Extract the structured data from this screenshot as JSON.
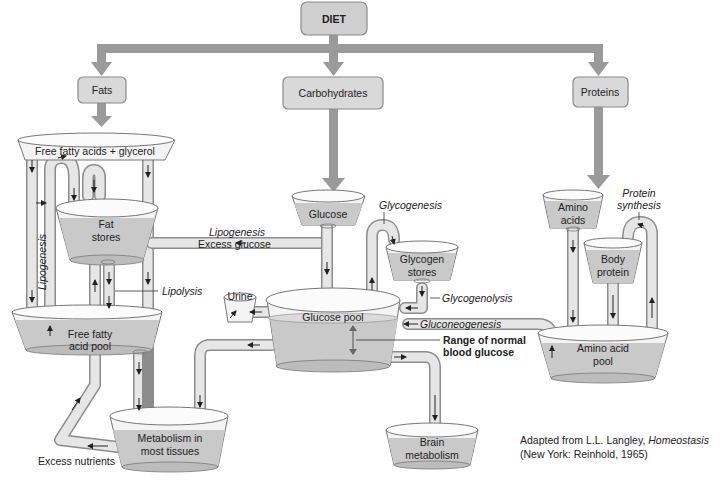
{
  "diagram": {
    "top": {
      "label": "DIET"
    },
    "sources": [
      {
        "id": "fats",
        "label": "Fats"
      },
      {
        "id": "carbohydrates",
        "label": "Carbohydrates"
      },
      {
        "id": "proteins",
        "label": "Proteins"
      }
    ],
    "reservoirs": {
      "ffa_glycerol": "Free fatty acids + glycerol",
      "fat_stores_1": "Fat",
      "fat_stores_2": "stores",
      "ffa_pool_1": "Free fatty",
      "ffa_pool_2": "acid pool",
      "metabolism_1": "Metabolism in",
      "metabolism_2": "most tissues",
      "glucose": "Glucose",
      "glycogen_1": "Glycogen",
      "glycogen_2": "stores",
      "urine": "Urine",
      "glucose_pool": "Glucose pool",
      "brain_1": "Brain",
      "brain_2": "metabolism",
      "amino_1": "Amino",
      "amino_2": "acids",
      "body_protein_1": "Body",
      "body_protein_2": "protein",
      "aa_pool_1": "Amino acid",
      "aa_pool_2": "pool"
    },
    "processes": {
      "lipogenesis_vertical": "Lipogenesis",
      "lipogenesis": "Lipogenesis",
      "excess_glucose": "Excess glucose",
      "lipolysis": "Lipolysis",
      "glycogenesis": "Glycogenesis",
      "glycogenolysis": "Glycogenolysis",
      "gluconeogenesis": "Gluconeogenesis",
      "range_1": "Range of normal",
      "range_2": "blood glucose",
      "protein_synthesis_1": "Protein",
      "protein_synthesis_2": "synthesis",
      "excess_nutrients": "Excess nutrients"
    },
    "credit": {
      "line1_prefix": "Adapted from L.L. Langley, ",
      "line1_title": "Homeostasis",
      "line2": "(New York: Reinhold, 1965)"
    },
    "colors": {
      "box_fill": "#d9d9d9",
      "arrow": "#9a9a9a",
      "liquid": "#c9c9c9",
      "pipe": "#e6e6e6"
    }
  }
}
